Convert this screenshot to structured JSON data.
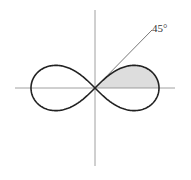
{
  "figure": {
    "angle_label": "45°",
    "colors": {
      "background": "#ffffff",
      "curve": "#222222",
      "axis": "#888888",
      "ray": "#555555",
      "shading": "#dddddd",
      "label": "#333333"
    },
    "geometry": {
      "center": [
        95,
        88
      ],
      "a": 64,
      "x_axis": [
        15,
        175
      ],
      "y_axis": [
        10,
        166
      ],
      "ray_end": [
        152,
        30
      ],
      "label_pos": [
        152,
        32
      ]
    }
  }
}
